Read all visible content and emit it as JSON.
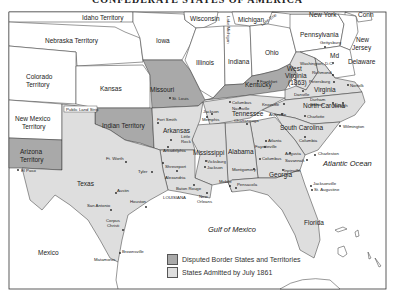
{
  "title": "CONFEDERATE STATES OF AMERICA",
  "colors": {
    "disputed": "#a9a9a9",
    "admitted": "#dedede",
    "union": "#ffffff",
    "border": "#333333"
  },
  "legend": {
    "items": [
      {
        "label": "Disputed Border States and Territories",
        "color": "#a9a9a9"
      },
      {
        "label": "States Admitted by July 1861",
        "color": "#dedede"
      }
    ]
  },
  "water_labels": {
    "atlantic": "Atlantic Ocean",
    "gulf": "Gulf of Mexico",
    "lake_erie": "Lake Erie",
    "lake_michigan": "Lake Michigan"
  },
  "regions": {
    "idaho": "Idaho Territory",
    "nebraska": "Nebraska Territory",
    "colorado": [
      "Colorado",
      "Territory"
    ],
    "kansas": "Kansas",
    "new_mexico": [
      "New Mexico",
      "Territory"
    ],
    "arizona": [
      "Arizona",
      "Territory"
    ],
    "public_land": "Public Land Strip",
    "indian": "Indian Territory",
    "iowa": "Iowa",
    "wisconsin": "Wisconsin",
    "michigan": "Michigan",
    "illinois": "Illinois",
    "indiana": "Indiana",
    "ohio": "Ohio",
    "missouri": "Missouri",
    "kentucky": "Kentucky",
    "west_virginia": [
      "West",
      "Virginia",
      "(1863)"
    ],
    "virginia": "Virginia",
    "pennsylvania": "Pennsylvania",
    "new_york": "New York",
    "conn": "Conn",
    "new_jersey": [
      "New",
      "Jersey"
    ],
    "md": "Md",
    "delaware": "Delaware",
    "north_carolina": "North Carolina",
    "south_carolina": "South Carolina",
    "tennessee": "Tennessee",
    "georgia": "Georgia",
    "alabama": "Alabama",
    "mississippi": "Mississippi",
    "arkansas": "Arkansas",
    "louisiana": "LOUISIANA",
    "texas": "Texas",
    "florida": "Florida",
    "mexico": "Mexico"
  },
  "cities": {
    "st_louis": "St. Louis",
    "frankfort": "Frankfort",
    "columbus_ky": "Columbus",
    "gettysburg": "Gettysburg",
    "washington": "Washington, D.C.",
    "richmond": "Richmond",
    "petersburg": "Petersburg",
    "danville": "Danville",
    "norfolk": "Norfolk",
    "durham": [
      "Durham",
      "Station"
    ],
    "raleigh": "Raleigh",
    "charlotte": "Charlotte",
    "wilmington": "Wilmington",
    "asheville": "Asheville",
    "knoxville": "Knoxville",
    "nashville": "Nashville",
    "jackson_tn": "Jackson",
    "memphis": "Memphis",
    "chattanooga": "Chattanooga",
    "columbia": "Columbia",
    "charleston": "Charleston",
    "atlanta": "Atlanta",
    "fayetteville": "Fayetteville",
    "augusta": "Augusta",
    "columbus_ga": "Columbus",
    "savannah": "Savannah",
    "irwinville": "Irwinville",
    "montgomery": "Montgomery",
    "mobile": "Mobile",
    "pensacola": "Pensacola",
    "jacksonville": "Jacksonville",
    "st_augustine": "St. Augustine",
    "vicksburg": "Vicksburg",
    "jackson_ms": "Jackson",
    "fort_smith": "Fort Smith",
    "little_rock": [
      "Little",
      "Rock"
    ],
    "arkadelphia": "Arkadelphia",
    "shreveport": "Shreveport",
    "alexandria": "Alexandria",
    "baton_rouge": "Baton Rouge",
    "new_orleans": [
      "New",
      "Orleans"
    ],
    "ft_worth": "Ft. Worth",
    "tyler": "Tyler",
    "austin": "Austin",
    "san_antonio": "San Antonio",
    "houston": "Houston",
    "corpus_christi": [
      "Corpus",
      "Christi"
    ],
    "brownsville": "Brownsville",
    "matamoros": "Matamoros",
    "el_paso": "El Paso"
  }
}
